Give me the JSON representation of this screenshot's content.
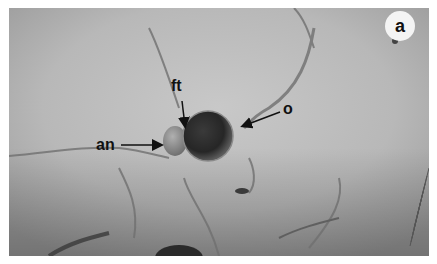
{
  "figure": {
    "panel_label": "a",
    "annotations": [
      {
        "id": "ft",
        "text": "ft"
      },
      {
        "id": "o",
        "text": "o"
      },
      {
        "id": "an",
        "text": "an"
      }
    ],
    "colors": {
      "background": "#b9b9b9",
      "oogonium": "#2a2a2a",
      "antheridium": "#8a8a8a",
      "hyphae": "#6a6a6a",
      "label": "#111111"
    }
  }
}
